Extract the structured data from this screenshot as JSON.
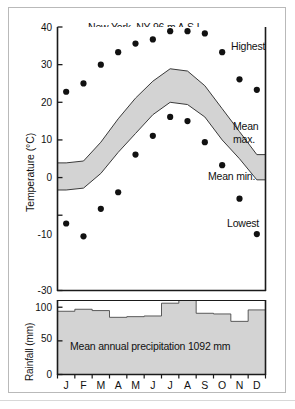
{
  "figure": {
    "title": "New York, NY 96 m A.S.L.",
    "annotations": {
      "highest": "Highest",
      "mean_max_line1": "Mean",
      "mean_max_line2": "max.",
      "mean_min": "Mean min.",
      "lowest": "Lowest"
    },
    "rain_caption": "Mean annual precipitation 1092 mm",
    "colors": {
      "band_fill": "#d3d3d3",
      "bar_fill": "#d3d3d3",
      "line": "#1a1a1a",
      "dot": "#111111",
      "frame": "#b9b9b9"
    }
  },
  "chart_data": [
    {
      "type": "line",
      "title": "New York, NY 96 m A.S.L.",
      "xlabel": "",
      "ylabel": "Temperature (°C)",
      "ylim": [
        -30,
        40
      ],
      "yticks": [
        40,
        30,
        20,
        10,
        0,
        -10,
        -30
      ],
      "ytick_labels": [
        "40",
        "30",
        "20",
        "10",
        "0",
        "-10",
        "-30"
      ],
      "grid": false,
      "legend_position": "right-inline",
      "categories": [
        "J",
        "F",
        "M",
        "A",
        "M",
        "J",
        "J",
        "A",
        "S",
        "O",
        "N",
        "D"
      ],
      "series": [
        {
          "name": "Highest",
          "style": "scatter",
          "values": [
            22.8,
            25.0,
            30.0,
            33.3,
            35.6,
            36.7,
            38.9,
            38.9,
            38.3,
            33.3,
            26.1,
            23.3
          ]
        },
        {
          "name": "Mean max.",
          "style": "band-upper",
          "values": [
            3.9,
            4.4,
            9.4,
            15.6,
            21.1,
            25.6,
            28.9,
            28.3,
            24.4,
            18.3,
            12.2,
            6.1
          ]
        },
        {
          "name": "Mean min.",
          "style": "band-lower",
          "values": [
            -3.3,
            -2.8,
            1.1,
            6.7,
            11.7,
            16.7,
            20.0,
            19.4,
            16.1,
            10.0,
            5.0,
            -0.6
          ]
        },
        {
          "name": "Lowest",
          "style": "scatter",
          "values": [
            -12.2,
            -15.6,
            -8.3,
            -3.9,
            6.1,
            11.1,
            16.1,
            15.0,
            9.4,
            3.3,
            -5.6,
            -15.0
          ]
        }
      ]
    },
    {
      "type": "bar",
      "title": "Mean annual precipitation 1092 mm",
      "xlabel": "",
      "ylabel": "Rainfall (mm)",
      "ylim": [
        0,
        110
      ],
      "yticks": [
        0,
        50,
        100
      ],
      "ytick_labels": [
        "0",
        "50",
        "100"
      ],
      "grid": false,
      "categories": [
        "J",
        "F",
        "M",
        "A",
        "M",
        "J",
        "J",
        "A",
        "S",
        "O",
        "N",
        "D"
      ],
      "values": [
        94,
        97,
        95,
        85,
        86,
        87,
        106,
        110,
        91,
        90,
        79,
        96
      ],
      "annual_total_mm": 1092
    }
  ],
  "axes": {
    "temperature": {
      "ylabel": "Temperature (°C)",
      "ticks": [
        "40",
        "30",
        "20",
        "10",
        "0",
        "-10",
        "-30"
      ]
    },
    "rainfall": {
      "ylabel": "Rainfall (mm)",
      "ticks": [
        "100",
        "50",
        "0"
      ]
    },
    "months": [
      "J",
      "F",
      "M",
      "A",
      "M",
      "J",
      "J",
      "A",
      "S",
      "O",
      "N",
      "D"
    ]
  }
}
